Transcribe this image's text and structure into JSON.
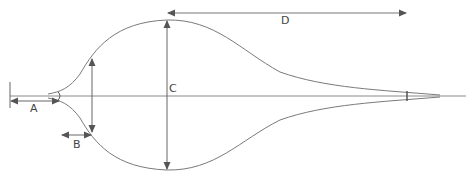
{
  "diagram": {
    "type": "dimension-diagram",
    "labels": {
      "A": "A",
      "B": "B",
      "C": "C",
      "D": "D"
    },
    "colors": {
      "line": "#7a7a7a",
      "arrow": "#555555",
      "text": "#444444",
      "background": "#ffffff"
    }
  }
}
